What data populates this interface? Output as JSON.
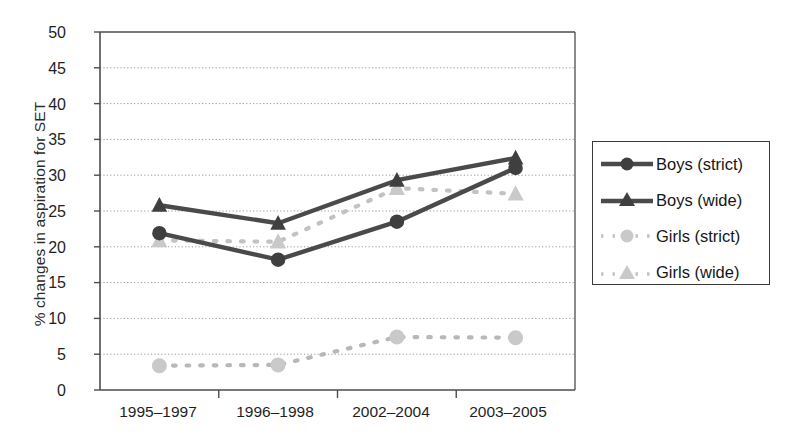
{
  "chart_data": {
    "type": "line",
    "title": "",
    "xlabel": "",
    "ylabel": "% changes in aspiration for SET",
    "categories": [
      "1995–1997",
      "1996–1998",
      "2002–2004",
      "2003–2005"
    ],
    "ylim": [
      0,
      50
    ],
    "ytick_step": 5,
    "yticks": [
      "50",
      "45",
      "40",
      "35",
      "30",
      "25",
      "20",
      "15",
      "10",
      "5",
      "0"
    ],
    "grid": "horizontal-dotted",
    "legend_position": "right-outside",
    "series": [
      {
        "name": "Boys (strict)",
        "values": [
          21.9,
          18.2,
          23.5,
          31.0
        ],
        "color": "#4a4a4a",
        "marker": "circle",
        "line": "solid"
      },
      {
        "name": "Boys (wide)",
        "values": [
          25.8,
          23.3,
          29.3,
          32.4
        ],
        "color": "#4a4a4a",
        "marker": "triangle",
        "line": "solid"
      },
      {
        "name": "Girls (strict)",
        "values": [
          3.4,
          3.5,
          7.4,
          7.3
        ],
        "color": "#b8b8b8",
        "marker": "circle",
        "line": "dotted"
      },
      {
        "name": "Girls (wide)",
        "values": [
          20.9,
          20.7,
          28.2,
          27.4
        ],
        "color": "#c2c2c2",
        "marker": "triangle",
        "line": "dotted"
      }
    ]
  },
  "legend": {
    "entries": [
      {
        "label": "Boys (strict)"
      },
      {
        "label": "Boys (wide)"
      },
      {
        "label": "Girls (strict)"
      },
      {
        "label": "Girls (wide)"
      }
    ]
  },
  "colors": {
    "dark_series": "#4a4a4a",
    "light_series": "#bfbfbf",
    "axis": "#4d4d4d",
    "grid": "#9a9a9a",
    "text": "#1a1a1a",
    "background": "#ffffff"
  }
}
